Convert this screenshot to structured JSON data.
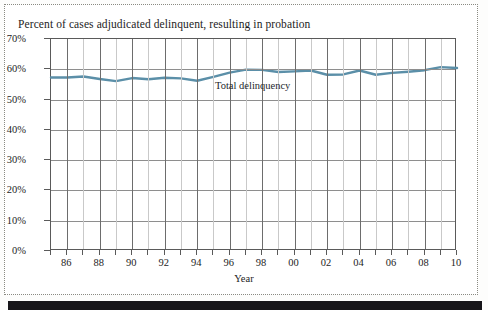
{
  "page": {
    "title": "Percent of cases adjudicated delinquent, resulting in probation",
    "axis_title": "Year",
    "series_label": "Total delinquency"
  },
  "chart_data": {
    "type": "line",
    "title": "Percent of cases adjudicated delinquent, resulting in probation",
    "xlabel": "Year",
    "ylabel": "",
    "xlim": [
      1985,
      2010
    ],
    "ylim": [
      0,
      70
    ],
    "grid": true,
    "legend_position": "inline-annotation",
    "line_color": "#5b8fa8",
    "ytick_labels": [
      "0%",
      "10%",
      "20%",
      "30%",
      "40%",
      "50%",
      "60%",
      "70%"
    ],
    "ytick_values": [
      0,
      10,
      20,
      30,
      40,
      50,
      60,
      70
    ],
    "xtick_labels": [
      "86",
      "88",
      "90",
      "92",
      "94",
      "96",
      "98",
      "00",
      "02",
      "04",
      "06",
      "08",
      "10"
    ],
    "xtick_values": [
      1986,
      1988,
      1990,
      1992,
      1994,
      1996,
      1998,
      2000,
      2002,
      2004,
      2006,
      2008,
      2010
    ],
    "x": [
      1985,
      1986,
      1987,
      1988,
      1989,
      1990,
      1991,
      1992,
      1993,
      1994,
      1995,
      1996,
      1997,
      1998,
      1999,
      2000,
      2001,
      2002,
      2003,
      2004,
      2005,
      2006,
      2007,
      2008,
      2009,
      2010
    ],
    "series": [
      {
        "name": "Total delinquency",
        "values": [
          57.3,
          57.3,
          57.6,
          56.8,
          56.1,
          57.1,
          56.7,
          57.2,
          57.0,
          56.2,
          57.5,
          58.9,
          59.9,
          59.8,
          59.1,
          59.3,
          59.6,
          58.2,
          58.3,
          59.6,
          58.2,
          58.8,
          59.2,
          59.7,
          60.7,
          60.4
        ]
      }
    ]
  }
}
